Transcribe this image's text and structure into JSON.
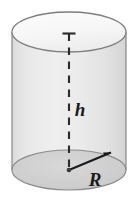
{
  "figure": {
    "name": "right-circular-cylinder-diagram",
    "type": "geometry-diagram",
    "shape": "cylinder",
    "background_color": "#ffffff"
  },
  "labels": {
    "height_label": "h",
    "radius_label": "R"
  },
  "colors": {
    "outline": "#6e6e6e",
    "body_fill": "#e9e9e9",
    "top_face_fill": "#fafafa",
    "bottom_face_fill": "#cfcfcf",
    "label_color": "#1a1a1a",
    "dashed_line_color": "#2b2b2b",
    "radius_arrow_color": "#1a1a1a"
  },
  "geometry": {
    "center_x": 69,
    "top_ellipse_center_y": 32,
    "bottom_ellipse_center_y": 170,
    "radius_x": 57,
    "radius_y": 20,
    "height_px": 138,
    "axis_top_y": 33,
    "axis_bottom_y": 170,
    "radius_arrow_tip_x": 112,
    "radius_arrow_tip_y": 152
  },
  "annotations": {
    "height_label_x": 80,
    "height_label_y": 112,
    "radius_label_x": 95,
    "radius_label_y": 182,
    "height_label_font_size": 19,
    "radius_label_font_size": 19
  }
}
